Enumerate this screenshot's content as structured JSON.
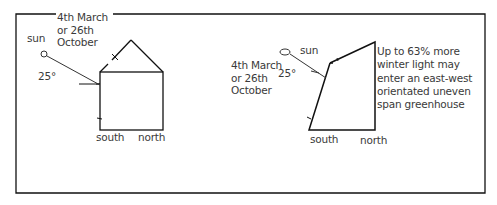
{
  "diagram": {
    "type": "greenhouse light comparison sketch",
    "left_panel": {
      "date_label": [
        "4th March",
        "or  26th",
        "October"
      ],
      "sun_label": "sun",
      "angle_label": "25°",
      "shape": "even span greenhouse (pitched roof)",
      "south_label": "south",
      "north_label": "north"
    },
    "right_panel": {
      "date_label": [
        "4th March",
        "or  26th",
        "October"
      ],
      "sun_label": "sun",
      "angle_label": "25°",
      "shape": "uneven span greenhouse",
      "south_label": "south",
      "north_label": "north",
      "note": [
        "Up to 63% more",
        "winter light may",
        "enter an east-west",
        "orientated uneven",
        "span greenhouse"
      ]
    },
    "colors": {
      "line": "#111111",
      "text": "#3a3a3a",
      "background": "#ffffff"
    }
  }
}
